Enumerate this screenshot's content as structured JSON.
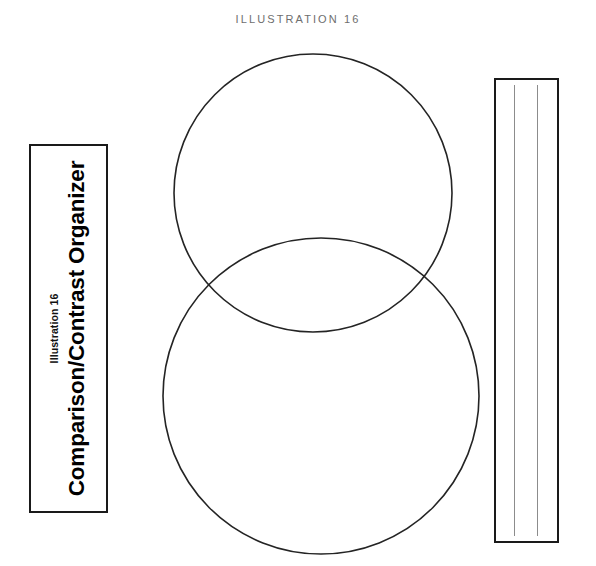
{
  "page": {
    "header_label": "ILLUSTRATION 16",
    "background_color": "#ffffff",
    "width": 596,
    "height": 566
  },
  "title_box": {
    "kicker": "Illustration 16",
    "title": "Comparison/Contrast Organizer",
    "border_color": "#1a1a1a",
    "rotation_degrees": -90
  },
  "venn": {
    "type": "venn-diagram",
    "stroke_color": "#242424",
    "fill": "none",
    "circles": [
      {
        "name": "top-circle",
        "label": "",
        "cx": 313,
        "cy": 193,
        "r": 139
      },
      {
        "name": "bottom-circle",
        "label": "",
        "cx": 321,
        "cy": 396,
        "r": 158
      }
    ]
  },
  "notes_strip": {
    "border_color": "#1a1a1a",
    "rule_color": "#8c8c8c",
    "rule_count": 2,
    "columns": 3
  }
}
